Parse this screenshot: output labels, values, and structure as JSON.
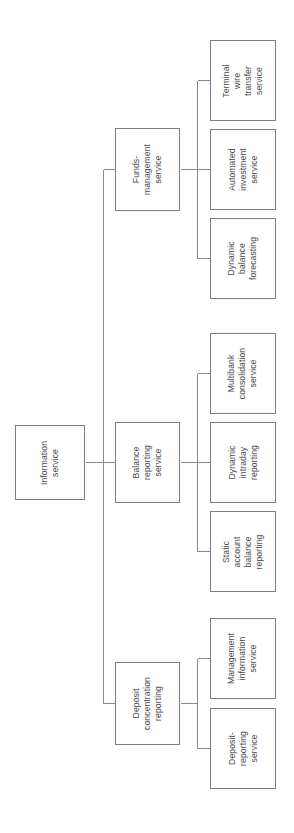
{
  "diagram": {
    "type": "tree",
    "orientation": "rotated-90-ccw",
    "root": {
      "id": "information-service",
      "label": "Information\nservice"
    },
    "level2": [
      {
        "id": "funds-management-service",
        "label": "Funds-\nmanagement\nservice"
      },
      {
        "id": "balance-reporting-service",
        "label": "Balance\nreporting\nservice"
      },
      {
        "id": "deposit-concentration-reporting",
        "label": "Deposit\nconcentration\nreporting"
      }
    ],
    "level3": [
      {
        "id": "terminal-wire-transfer-service",
        "parent": "funds-management-service",
        "label": "Terminal\nwire\ntransfer\nservice"
      },
      {
        "id": "automated-investment-service",
        "parent": "funds-management-service",
        "label": "Automated\ninvestment\nservice"
      },
      {
        "id": "dynamic-balance-forecasting",
        "parent": "funds-management-service",
        "label": "Dynamic\nbalance\nforecasting"
      },
      {
        "id": "multibank-consolidation-service",
        "parent": "balance-reporting-service",
        "label": "Multibank\nconsolidation\nservice"
      },
      {
        "id": "dynamic-intraday-reporting",
        "parent": "balance-reporting-service",
        "label": "Dynamic\nintraday\nreporting"
      },
      {
        "id": "static-account-balance-reporting",
        "parent": "balance-reporting-service",
        "label": "Static\naccount\nbalance\nreporting"
      },
      {
        "id": "management-information-service",
        "parent": "deposit-concentration-reporting",
        "label": "Management\ninformation\nservice"
      },
      {
        "id": "deposit-reporting-service",
        "parent": "deposit-concentration-reporting",
        "label": "Deposit-\nreporting\nservice"
      }
    ],
    "colors": {
      "background": "#ffffff",
      "box_border": "#7d7d7d",
      "connector": "#8a8a8a",
      "text": "#4a4a4a"
    }
  }
}
